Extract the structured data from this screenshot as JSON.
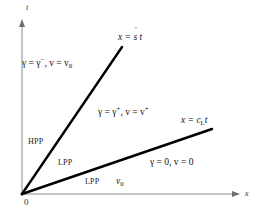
{
  "figure": {
    "background": "#ffffff",
    "line_color": "#000000",
    "axis_color": "#8a8a8a",
    "axes": {
      "vertical_label": "t",
      "horizontal_label": "x",
      "origin_label": "0"
    },
    "rays": [
      {
        "name": "shock-ray",
        "label_prefix": "x = ",
        "label_symbol": "s",
        "label_suffix": " t",
        "label_full": "x = ṡ t",
        "from": [
          22,
          194
        ],
        "to": [
          122,
          47
        ]
      },
      {
        "name": "cl-ray",
        "label_prefix": "x = c",
        "label_subscript": "L",
        "label_suffix": "t",
        "label_full": "x = c_L t",
        "from": [
          22,
          194
        ],
        "to": [
          212,
          129
        ]
      }
    ],
    "annotations": {
      "upper_state": {
        "gamma_prefix": "γ = γ",
        "gamma_sup": "−",
        "v_prefix": ", v = v",
        "v_sub": "0",
        "full": "γ = γ⁻, v = v₀"
      },
      "middle_state": {
        "gamma_prefix": "γ = γ",
        "gamma_sup": "+",
        "v_prefix": ", v = v",
        "v_sup": "+",
        "full": "γ = γ⁺, v = v⁺"
      },
      "lower_state": {
        "full": "γ = 0, v = 0"
      },
      "v_zero": {
        "symbol": "v",
        "subscript": "0",
        "full": "v₀"
      }
    },
    "regions": [
      {
        "name": "hpp-region",
        "label": "HPP"
      },
      {
        "name": "lpp-region-upper",
        "label": "LPP"
      },
      {
        "name": "lpp-region-lower",
        "label": "LPP"
      }
    ]
  }
}
